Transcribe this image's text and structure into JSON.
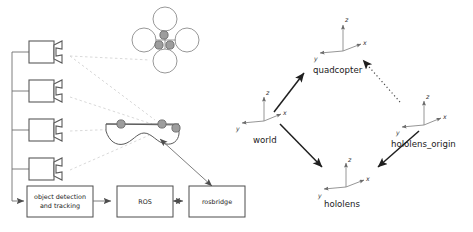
{
  "figure": {
    "background_color": "#ffffff",
    "line_color": "#4d4d4d",
    "dashed_color": "#c8c8c8",
    "dotted_color": "#9a9a9a",
    "marker_fill": "#9d9d9d",
    "text_color": "#1a1a1a"
  },
  "left_panel": {
    "cameras": [
      {
        "id": "camera-1"
      },
      {
        "id": "camera-2"
      },
      {
        "id": "camera-3"
      },
      {
        "id": "camera-4"
      }
    ],
    "quadcopter": {
      "id": "quadcopter-drawing",
      "rotor_count": 4,
      "marker_count": 3
    },
    "hololens": {
      "id": "hololens-drawing",
      "marker_count": 3
    },
    "boxes": [
      {
        "id": "object-detection-box",
        "line1": "object detection",
        "line2": "and tracking"
      },
      {
        "id": "ros-box",
        "line1": "ROS",
        "line2": ""
      },
      {
        "id": "rosbridge-box",
        "line1": "rosbridge",
        "line2": ""
      }
    ]
  },
  "right_panel": {
    "frames": [
      {
        "id": "frame-quadcopter",
        "name": "quadcopter",
        "x_label": "x",
        "y_label": "y",
        "z_label": "z"
      },
      {
        "id": "frame-world",
        "name": "world",
        "x_label": "x",
        "y_label": "y",
        "z_label": "z"
      },
      {
        "id": "frame-hololens-origin",
        "name": "hololens_origin",
        "x_label": "x",
        "y_label": "y",
        "z_label": "z"
      },
      {
        "id": "frame-hololens",
        "name": "hololens",
        "x_label": "x",
        "y_label": "y",
        "z_label": "z"
      }
    ],
    "edges": [
      {
        "id": "edge-world-quadcopter",
        "from": "world",
        "to": "quadcopter",
        "style": "solid"
      },
      {
        "id": "edge-world-hololens",
        "from": "world",
        "to": "hololens",
        "style": "solid"
      },
      {
        "id": "edge-hololens-origin-hololens",
        "from": "hololens_origin",
        "to": "hololens",
        "style": "solid"
      },
      {
        "id": "edge-hololens-origin-quadcopter",
        "from": "hololens_origin",
        "to": "quadcopter",
        "style": "dotted"
      }
    ]
  }
}
